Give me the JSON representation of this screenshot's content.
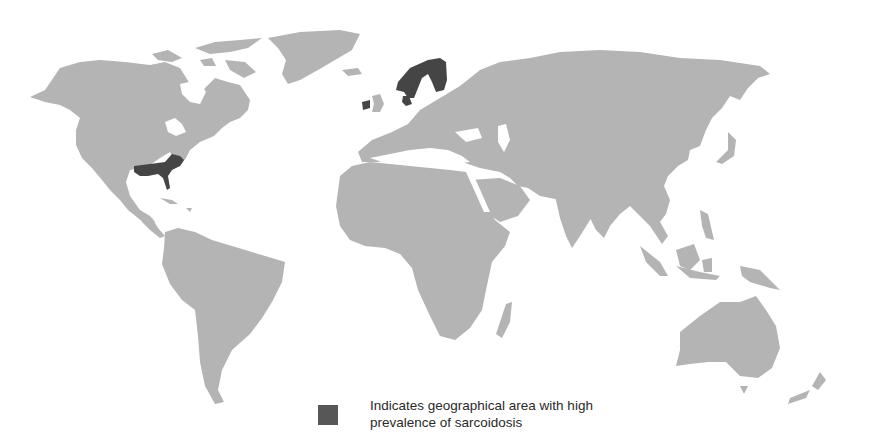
{
  "figure": {
    "type": "world-map",
    "land_color": "#b4b4b4",
    "highlight_color": "#454545",
    "background_color": "#ffffff"
  },
  "highlighted_regions": [
    {
      "name": "Scandinavia (Norway, Sweden, Finland)"
    },
    {
      "name": "Denmark"
    },
    {
      "name": "Ireland"
    },
    {
      "name": "Southeastern United States"
    }
  ],
  "legend": {
    "swatch_color": "#575757",
    "label": "Indicates geographical area with high prevalence of sarcoidosis"
  }
}
